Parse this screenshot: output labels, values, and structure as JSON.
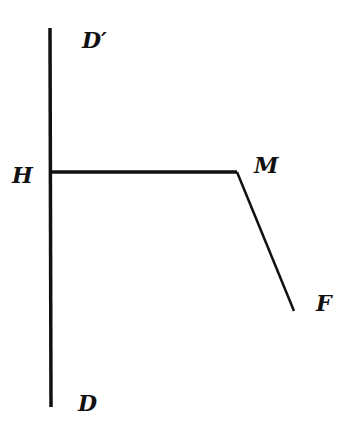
{
  "diagram": {
    "labels": {
      "d_prime": "D′",
      "h": "H",
      "m": "M",
      "f": "F",
      "d": "D"
    },
    "colors": {
      "stroke": "#111111",
      "background": "#ffffff"
    }
  }
}
